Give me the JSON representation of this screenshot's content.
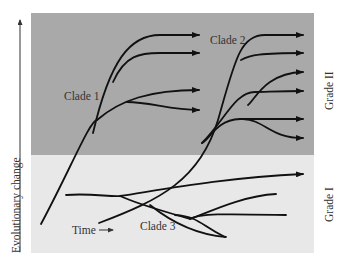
{
  "diagram": {
    "colors": {
      "grade_ii_bg": "#a9a9a9",
      "grade_i_bg": "#e8e8e8",
      "lines": "#111111",
      "text": "#333333"
    },
    "labels": {
      "y_axis": "Evolutionary change",
      "x_axis": "Time",
      "clade1": "Clade 1",
      "clade2": "Clade 2",
      "clade3": "Clade 3",
      "grade2": "Grade II",
      "grade1": "Grade I"
    }
  }
}
